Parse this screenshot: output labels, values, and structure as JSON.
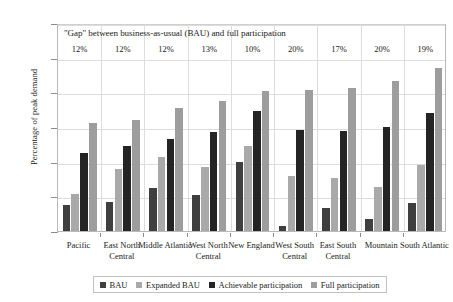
{
  "chart_data": {
    "type": "bar",
    "title": "\"Gap\" between business-as-usual (BAU) and full participation",
    "xlabel": "",
    "ylabel": "Percentage of peak demand",
    "ylim": [
      0,
      30
    ],
    "yticks": [
      "0%",
      "5%",
      "10%",
      "15%",
      "20%",
      "25%",
      "30%"
    ],
    "ytick_values": [
      0,
      5,
      10,
      15,
      20,
      25,
      30
    ],
    "grid": true,
    "legend_position": "bottom",
    "categories": [
      "Pacific",
      "East North Central",
      "Middle Atlantic",
      "West North Central",
      "New England",
      "West South Central",
      "East South Central",
      "Mountain",
      "South Atlantic"
    ],
    "series": [
      {
        "name": "BAU",
        "color": "#3f3f3f",
        "values": [
          3.8,
          4.2,
          6.2,
          5.2,
          10.0,
          0.7,
          3.3,
          1.7,
          4.0
        ]
      },
      {
        "name": "Expanded BAU",
        "color": "#a9a9a9",
        "values": [
          5.4,
          9.0,
          10.7,
          9.3,
          12.2,
          8.0,
          7.6,
          6.3,
          9.5
        ]
      },
      {
        "name": "Achievable participation",
        "color": "#242424",
        "values": [
          11.2,
          12.3,
          13.2,
          14.3,
          17.3,
          14.5,
          14.4,
          15.0,
          17.0
        ]
      },
      {
        "name": "Full participation",
        "color": "#9d9d9d",
        "values": [
          15.6,
          16.0,
          17.8,
          18.7,
          20.2,
          20.4,
          20.6,
          21.7,
          23.5
        ]
      }
    ],
    "annotations": {
      "label": "gap",
      "values": [
        "12%",
        "12%",
        "12%",
        "13%",
        "10%",
        "20%",
        "17%",
        "20%",
        "19%"
      ]
    }
  }
}
